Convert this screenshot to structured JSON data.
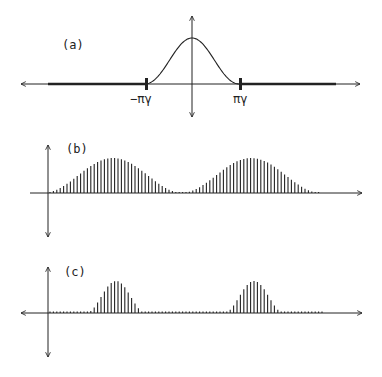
{
  "panels": [
    {
      "id": "a",
      "label": "(a)",
      "description": "Continuous bell-shaped spectrum bounded between -πγ and πγ",
      "tick_labels": [
        "−πγ",
        "πγ"
      ]
    },
    {
      "id": "b",
      "label": "(b)",
      "description": "Sampled spectrum: broad bumps repeating with overlap near zero"
    },
    {
      "id": "c",
      "label": "(c)",
      "description": "Sampled spectrum: narrow bumps separated by flat near-zero regions"
    }
  ],
  "colors": {
    "ink": "#222222",
    "background": "#ffffff"
  },
  "chart_data": [
    {
      "type": "line",
      "panel": "a",
      "title": "(a)",
      "x_ticks": [
        "−πγ",
        "πγ"
      ],
      "shape": "gaussian-like bump centered at 0, zero outside [−πγ, πγ]",
      "peak_x": 0,
      "support": [
        -1,
        1
      ]
    },
    {
      "type": "bar",
      "panel": "b",
      "title": "(b)",
      "shape": "stem plot of two wide raised bumps",
      "bump_centers_px": [
        113,
        251
      ],
      "bump_halfwidth_px": 70,
      "stem_spacing_px": 3.4
    },
    {
      "type": "bar",
      "panel": "c",
      "title": "(c)",
      "shape": "stem plot of two narrow bumps with flat gaps",
      "bump_centers_px": [
        116,
        254
      ],
      "bump_halfwidth_px": 30,
      "stem_spacing_px": 3.4
    }
  ]
}
